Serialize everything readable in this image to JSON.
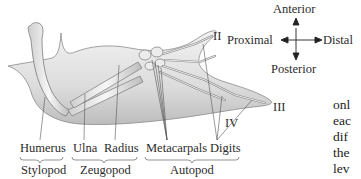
{
  "figure": {
    "bone_labels": {
      "humerus": "Humerus",
      "ulna": "Ulna",
      "radius": "Radius",
      "metacarpals": "Metacarpals",
      "digits": "Digits"
    },
    "segment_labels": {
      "stylopod": "Stylopod",
      "zeugopod": "Zeugopod",
      "autopod": "Autopod"
    },
    "digit_numerals": {
      "ii": "II",
      "iii": "III",
      "iv": "IV"
    },
    "compass": {
      "anterior": "Anterior",
      "posterior": "Posterior",
      "proximal": "Proximal",
      "distal": "Distal"
    }
  },
  "body_text_fragments": [
    "onl",
    "eac",
    "dif",
    "the",
    "lev",
    "(se"
  ]
}
